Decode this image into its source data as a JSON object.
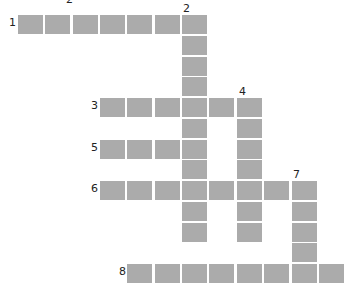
{
  "puzzle": {
    "type": "crossword",
    "cell_color": "#ababab",
    "background": "#ffffff",
    "cell_w": 27.35,
    "cell_h": 20.75,
    "origin_x": 18,
    "origin_y": 15,
    "clues": [
      {
        "number": "1",
        "direction": "across",
        "row": 0,
        "col": 0,
        "length": 7
      },
      {
        "number": "2",
        "direction": "down",
        "row": 0,
        "col": 6,
        "length": 11
      },
      {
        "number": "3",
        "direction": "across",
        "row": 4,
        "col": 3,
        "length": 6
      },
      {
        "number": "4",
        "direction": "down",
        "row": 4,
        "col": 8,
        "length": 7
      },
      {
        "number": "5",
        "direction": "across",
        "row": 6,
        "col": 3,
        "length": 4
      },
      {
        "number": "6",
        "direction": "across",
        "row": 8,
        "col": 3,
        "length": 8
      },
      {
        "number": "7",
        "direction": "down",
        "row": 8,
        "col": 10,
        "length": 5
      },
      {
        "number": "8",
        "direction": "across",
        "row": 12,
        "col": 4,
        "length": 8
      }
    ],
    "number_labels": [
      {
        "text": "1",
        "x": 9,
        "y": 17
      },
      {
        "text": "2",
        "x": 183,
        "y": 3
      },
      {
        "text": "3",
        "x": 91,
        "y": 100
      },
      {
        "text": "4",
        "x": 239,
        "y": 86
      },
      {
        "text": "5",
        "x": 91,
        "y": 142
      },
      {
        "text": "6",
        "x": 91,
        "y": 183
      },
      {
        "text": "7",
        "x": 293,
        "y": 169
      },
      {
        "text": "8",
        "x": 119,
        "y": 266
      }
    ]
  }
}
